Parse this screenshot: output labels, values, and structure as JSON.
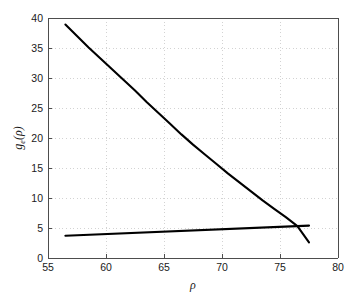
{
  "chart_data": {
    "type": "line",
    "title": "",
    "subtitle": "",
    "xlabel": "ρ",
    "ylabel": "g_e(ρ)",
    "ylabel_base": "g",
    "ylabel_subscript": "e",
    "ylabel_arg": "(ρ)",
    "xlim": [
      55,
      80
    ],
    "ylim": [
      0,
      40
    ],
    "xticks": [
      55,
      60,
      65,
      70,
      75,
      80
    ],
    "yticks": [
      0,
      5,
      10,
      15,
      20,
      25,
      30,
      35,
      40
    ],
    "xtick_labels": [
      "55",
      "60",
      "65",
      "70",
      "75",
      "80"
    ],
    "ytick_labels": [
      "0",
      "5",
      "10",
      "15",
      "20",
      "25",
      "30",
      "35",
      "40"
    ],
    "grid": true,
    "grid_style": "dotted",
    "grid_color": "#c8c8c8",
    "legend": null,
    "legend_position": "none",
    "background_color": "#ffffff",
    "axis_color": "#4d4d4d",
    "series": [
      {
        "name": "decreasing-curve",
        "color": "#000000",
        "linewidth": 2.1,
        "x": [
          56.5,
          57.5,
          58.5,
          59.5,
          60.5,
          61.5,
          62.5,
          63.5,
          64.5,
          65.5,
          66.5,
          67.5,
          68.5,
          69.5,
          70.5,
          71.5,
          72.5,
          73.5,
          74.5,
          75.5,
          76.5,
          77.5
        ],
        "y": [
          38.9,
          37.0,
          35.1,
          33.3,
          31.5,
          29.7,
          27.9,
          26.0,
          24.2,
          22.4,
          20.6,
          18.9,
          17.3,
          15.7,
          14.1,
          12.6,
          11.1,
          9.6,
          8.2,
          6.8,
          5.3,
          2.6
        ]
      },
      {
        "name": "increasing-line",
        "color": "#000000",
        "linewidth": 2.1,
        "x": [
          56.5,
          77.5
        ],
        "y": [
          3.7,
          5.4
        ]
      }
    ],
    "annotations": [
      {
        "name": "crossing-point",
        "x": 75.6,
        "y": 5.25
      }
    ]
  }
}
